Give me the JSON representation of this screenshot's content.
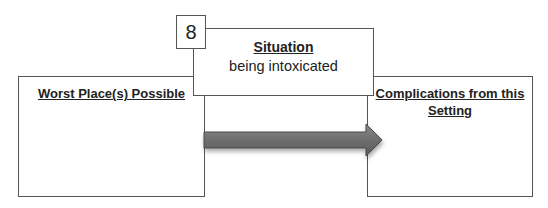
{
  "diagram": {
    "number": "8",
    "situation": {
      "title": "Situation",
      "text": "being intoxicated"
    },
    "left_box": {
      "title": "Worst Place(s) Possible"
    },
    "right_box": {
      "title": "Complications from this Setting"
    },
    "arrow": {
      "direction": "right",
      "color": "#6e6e6e"
    }
  }
}
